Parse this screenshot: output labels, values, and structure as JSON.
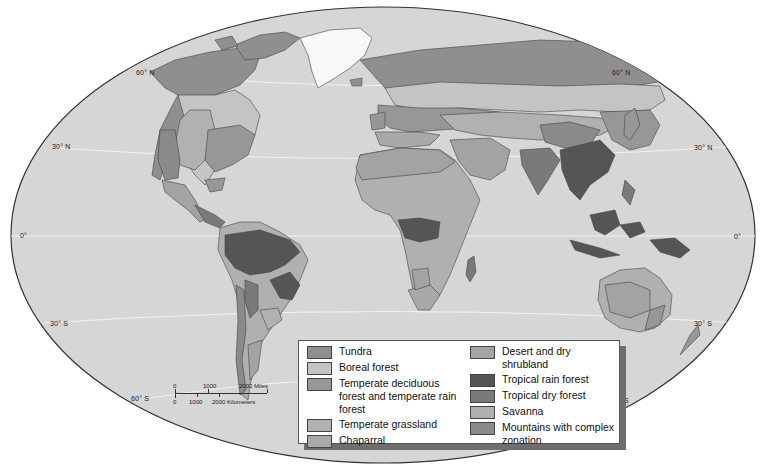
{
  "map": {
    "ocean_color": "#d6d6d6",
    "land_base_color": "#bdbdbd",
    "ice_color": "#f8f8f8",
    "outline_color": "#333333",
    "graticule_color": "#f4f4f4"
  },
  "latitude_labels": {
    "n60_left": "60° N",
    "n60_right": "60° N",
    "n30_left": "30° N",
    "n30_right": "30° N",
    "eq_left": "0°",
    "eq_right": "0°",
    "s30_left": "30° S",
    "s30_right": "30° S",
    "s60_left": "60° S",
    "s60_right": "S"
  },
  "scale_bar": {
    "miles_0": "0",
    "miles_1000": "1000",
    "miles_2000": "2000 Miles",
    "km_0": "0",
    "km_1000": "1000",
    "km_2000": "2000 Kilometers"
  },
  "legend": {
    "left": [
      {
        "label": "Tundra",
        "color": "#8f8f8f"
      },
      {
        "label": "Boreal forest",
        "color": "#c4c4c4"
      },
      {
        "label": "Temperate deciduous forest and temperate rain forest",
        "color": "#979797"
      },
      {
        "label": "Temperate grassland",
        "color": "#b1b1b1"
      },
      {
        "label": "Chaparral",
        "color": "#a9a9a9"
      }
    ],
    "right": [
      {
        "label": "Desert and dry shrubland",
        "color": "#a3a3a3"
      },
      {
        "label": "Tropical rain forest",
        "color": "#555555"
      },
      {
        "label": "Tropical dry forest",
        "color": "#7a7a7a"
      },
      {
        "label": "Savanna",
        "color": "#b0b0b0"
      },
      {
        "label": "Mountains with complex zonation",
        "color": "#8a8a8a"
      }
    ]
  }
}
